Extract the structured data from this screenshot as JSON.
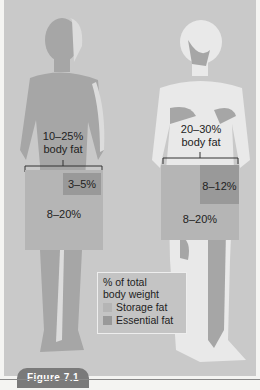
{
  "colors": {
    "background_panel": "#c9c9c9",
    "male_silhouette": "#a6a6a6",
    "female_silhouette": "#e9e9e9",
    "storage_fat": "#b5b5b5",
    "essential_fat": "#999999",
    "figure_tab": "#7a7a7a"
  },
  "male": {
    "total_label_line1": "10–25%",
    "total_label_line2": "body fat",
    "essential": "3–5%",
    "storage": "8–20%"
  },
  "female": {
    "total_label_line1": "20–30%",
    "total_label_line2": "body fat",
    "essential": "8–12%",
    "storage": "8–20%"
  },
  "legend": {
    "title_line1": "% of total",
    "title_line2": "body weight",
    "items": [
      {
        "label": "Storage fat",
        "color": "#b5b5b5"
      },
      {
        "label": "Essential fat",
        "color": "#999999"
      }
    ]
  },
  "figure_label": "Figure 7.1"
}
